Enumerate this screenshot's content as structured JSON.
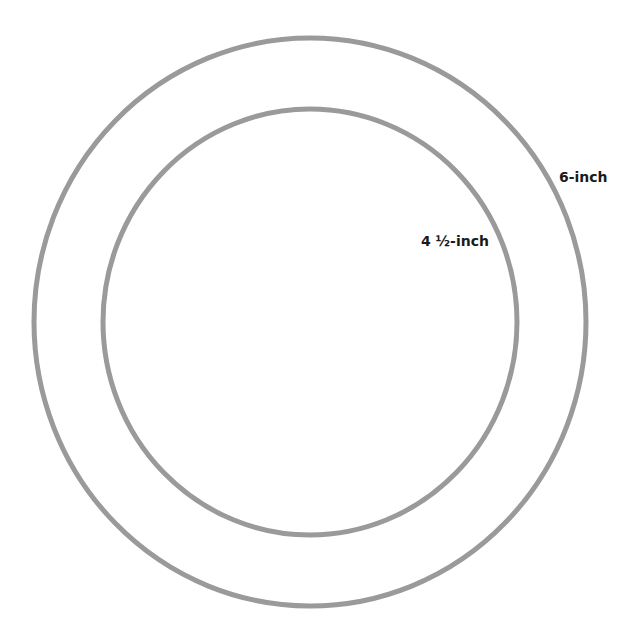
{
  "diagram": {
    "stroke_color": "#9a9a9a",
    "stroke_width": 5,
    "background": "#ffffff",
    "circles": [
      {
        "id": "outer",
        "label": "6-inch",
        "cx": 310,
        "cy": 322,
        "rx": 276,
        "ry": 284
      },
      {
        "id": "inner",
        "label": "4 ½-inch",
        "cx": 310,
        "cy": 322,
        "rx": 207,
        "ry": 213
      }
    ]
  }
}
